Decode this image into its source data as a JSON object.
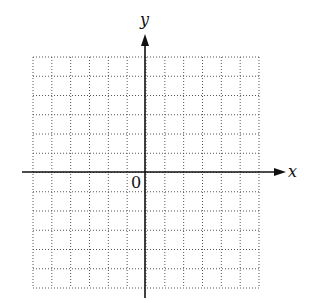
{
  "diagram": {
    "title": "",
    "x_axis_label": "x",
    "y_axis_label": "y",
    "origin_label": "0",
    "grid": {
      "columns": 12,
      "rows": 12,
      "style": "dotted"
    },
    "colors": {
      "axis": "#111111",
      "grid": "#555555",
      "background": "#ffffff"
    }
  }
}
